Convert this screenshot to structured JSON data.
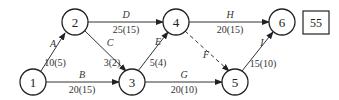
{
  "diagram": {
    "type": "activity-on-arrow network",
    "nodes": [
      {
        "id": "1",
        "label": "1",
        "x": 33,
        "y": 82
      },
      {
        "id": "2",
        "label": "2",
        "x": 75,
        "y": 22
      },
      {
        "id": "3",
        "label": "3",
        "x": 132,
        "y": 82
      },
      {
        "id": "4",
        "label": "4",
        "x": 176,
        "y": 22
      },
      {
        "id": "5",
        "label": "5",
        "x": 235,
        "y": 82
      },
      {
        "id": "6",
        "label": "6",
        "x": 282,
        "y": 22
      }
    ],
    "edges": [
      {
        "activity": "A",
        "from": "1",
        "to": "2",
        "duration": "10(5)",
        "dashed": false
      },
      {
        "activity": "B",
        "from": "1",
        "to": "3",
        "duration": "20(15)",
        "dashed": false
      },
      {
        "activity": "C",
        "from": "2",
        "to": "3",
        "duration": "3(2)",
        "dashed": false
      },
      {
        "activity": "D",
        "from": "2",
        "to": "4",
        "duration": "25(15)",
        "dashed": false
      },
      {
        "activity": "E",
        "from": "3",
        "to": "4",
        "duration": "5(4)",
        "dashed": false
      },
      {
        "activity": "F",
        "from": "4",
        "to": "5",
        "duration": "",
        "dashed": true
      },
      {
        "activity": "G",
        "from": "3",
        "to": "5",
        "duration": "20(10)",
        "dashed": false
      },
      {
        "activity": "H",
        "from": "4",
        "to": "6",
        "duration": "20(15)",
        "dashed": false
      },
      {
        "activity": "I",
        "from": "5",
        "to": "6",
        "duration": "15(10)",
        "dashed": false
      }
    ],
    "total_box": {
      "value": "55"
    }
  }
}
